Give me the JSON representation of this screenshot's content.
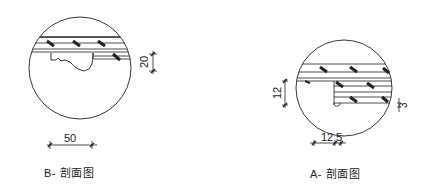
{
  "drawings": [
    {
      "id": "B",
      "title": "B- 剖面图",
      "dimensions": {
        "horizontal": "50",
        "vertical": "20"
      }
    },
    {
      "id": "A",
      "title": "A- 剖面图",
      "dimensions": {
        "horizontal_left": "12",
        "horizontal_right": "5",
        "vertical_left": "12",
        "vertical_right": "3"
      }
    }
  ],
  "colors": {
    "line": "#222222",
    "background": "#ffffff"
  }
}
